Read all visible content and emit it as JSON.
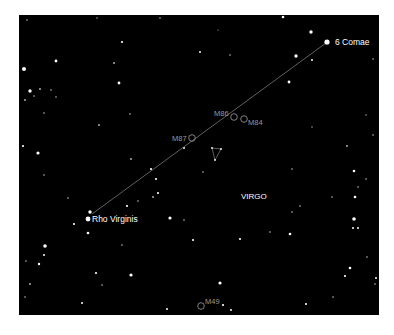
{
  "chart_data": {
    "type": "star_map",
    "title": "",
    "background_color": "#000000",
    "panel": {
      "x": 19,
      "y": 15,
      "width": 360,
      "height": 300
    },
    "constellation_label": {
      "text": "VIRGO",
      "x": 241,
      "y": 199
    },
    "named_stars": [
      {
        "name": "6 Comae",
        "x": 327,
        "y": 42,
        "r": 2.6,
        "label_dx": 8,
        "label_dy": 3
      },
      {
        "name": "Rho Virginis",
        "x": 88,
        "y": 219,
        "r": 2.4,
        "label_dx": 4,
        "label_dy": 3
      }
    ],
    "pointer_line": {
      "from": "Rho Virginis",
      "to": "6 Comae",
      "x1": 92,
      "y1": 214,
      "x2": 326,
      "y2": 43,
      "color": "#8a8a8a"
    },
    "messier_objects": [
      {
        "name": "M86",
        "x": 234,
        "y": 117,
        "r": 3.3,
        "label_x": 214,
        "label_y": 116
      },
      {
        "name": "M84",
        "x": 244,
        "y": 119,
        "r": 3.3,
        "label_x": 248,
        "label_y": 125
      },
      {
        "name": "M87",
        "x": 192,
        "y": 138,
        "r": 3.3,
        "label_x": 172,
        "label_y": 141
      },
      {
        "name": "M49",
        "x": 201,
        "y": 306,
        "r": 3.3,
        "label_x": 205,
        "label_y": 304
      }
    ],
    "asterism_triangle": [
      [
        212,
        148
      ],
      [
        221,
        149
      ],
      [
        215,
        160
      ]
    ],
    "stars": [
      [
        283,
        17,
        1.3
      ],
      [
        311,
        32,
        1.7
      ],
      [
        296,
        56,
        1.7
      ],
      [
        312,
        60,
        1.0
      ],
      [
        373,
        59,
        0.8
      ],
      [
        289,
        82,
        1.4
      ],
      [
        122,
        42,
        1.1
      ],
      [
        200,
        52,
        1.0
      ],
      [
        230,
        55,
        0.8
      ],
      [
        114,
        63,
        0.9
      ],
      [
        56,
        61,
        1.4
      ],
      [
        24,
        69,
        2.0
      ],
      [
        119,
        83,
        1.4
      ],
      [
        30,
        91,
        1.7
      ],
      [
        40,
        89,
        0.9
      ],
      [
        51,
        90,
        0.8
      ],
      [
        34,
        96,
        0.8
      ],
      [
        56,
        97,
        0.8
      ],
      [
        25,
        100,
        0.9
      ],
      [
        130,
        114,
        0.8
      ],
      [
        99,
        125,
        0.9
      ],
      [
        44,
        113,
        0.8
      ],
      [
        373,
        135,
        0.8
      ],
      [
        366,
        115,
        0.7
      ],
      [
        23,
        146,
        1.1
      ],
      [
        38,
        153,
        1.6
      ],
      [
        131,
        159,
        0.9
      ],
      [
        184,
        148,
        1.0
      ],
      [
        203,
        172,
        0.8
      ],
      [
        151,
        169,
        1.1
      ],
      [
        156,
        179,
        1.1
      ],
      [
        44,
        175,
        0.8
      ],
      [
        347,
        146,
        0.9
      ],
      [
        292,
        169,
        0.8
      ],
      [
        354,
        171,
        1.3
      ],
      [
        366,
        179,
        0.8
      ],
      [
        358,
        187,
        0.8
      ],
      [
        158,
        193,
        1.1
      ],
      [
        153,
        197,
        0.9
      ],
      [
        138,
        201,
        0.8
      ],
      [
        127,
        206,
        1.1
      ],
      [
        68,
        198,
        0.8
      ],
      [
        355,
        197,
        1.3
      ],
      [
        332,
        197,
        0.8
      ],
      [
        300,
        206,
        0.8
      ],
      [
        292,
        212,
        0.8
      ],
      [
        90,
        212,
        1.7
      ],
      [
        170,
        218,
        1.6
      ],
      [
        184,
        220,
        0.8
      ],
      [
        74,
        224,
        1.1
      ],
      [
        88,
        233,
        1.3
      ],
      [
        354,
        219,
        1.8
      ],
      [
        353,
        228,
        1.0
      ],
      [
        358,
        228,
        1.0
      ],
      [
        290,
        234,
        1.3
      ],
      [
        270,
        232,
        0.8
      ],
      [
        240,
        239,
        1.1
      ],
      [
        193,
        240,
        1.1
      ],
      [
        122,
        245,
        0.8
      ],
      [
        45,
        246,
        1.8
      ],
      [
        44,
        255,
        1.0
      ],
      [
        39,
        264,
        1.2
      ],
      [
        26,
        261,
        0.8
      ],
      [
        367,
        257,
        0.8
      ],
      [
        350,
        268,
        1.3
      ],
      [
        345,
        276,
        1.1
      ],
      [
        376,
        278,
        1.0
      ],
      [
        96,
        273,
        1.1
      ],
      [
        131,
        275,
        1.6
      ],
      [
        102,
        285,
        0.8
      ],
      [
        30,
        284,
        0.9
      ],
      [
        220,
        283,
        1.6
      ],
      [
        223,
        305,
        1.1
      ],
      [
        231,
        310,
        1.0
      ],
      [
        306,
        304,
        1.1
      ],
      [
        333,
        297,
        0.8
      ],
      [
        167,
        309,
        1.0
      ],
      [
        82,
        303,
        1.0
      ],
      [
        25,
        297,
        0.8
      ],
      [
        375,
        284,
        0.8
      ],
      [
        160,
        18,
        0.8
      ],
      [
        97,
        18,
        0.7
      ],
      [
        27,
        20,
        0.8
      ],
      [
        218,
        30,
        0.6
      ],
      [
        312,
        127,
        0.7
      ]
    ]
  }
}
